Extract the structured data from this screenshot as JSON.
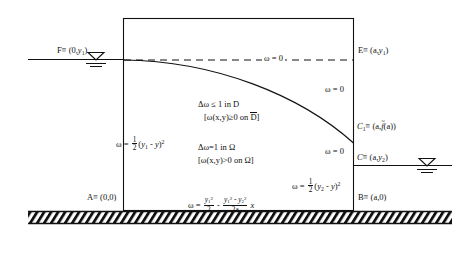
{
  "figure": {
    "type": "free-boundary-seepage-diagram"
  },
  "geometry": {
    "rect": {
      "x": 123,
      "y": 18,
      "w": 231,
      "h": 192
    },
    "water_left_y": 59,
    "water_right_y": 165,
    "ground_y": 211,
    "ground_height": 12,
    "free_surface": {
      "start": [
        123,
        60
      ],
      "end": [
        354,
        143
      ],
      "control1": [
        215,
        61
      ],
      "control2": [
        300,
        95
      ]
    },
    "dashed_y": 60
  },
  "colors": {
    "ink": "#111111",
    "background": "#ffffff",
    "hatch": "#111111"
  },
  "points": {
    "F": {
      "label_name": "F",
      "label_eq": "≡ (0,",
      "sub": "1",
      "close": ")",
      "x": 57,
      "y": 50
    },
    "E": {
      "label_name": "E",
      "label_eq": "≡ (a,",
      "sub": "1",
      "close": ")",
      "x": 358,
      "y": 50
    },
    "C1": {
      "label": "C",
      "sub": "1",
      "eq": "≡ (a,",
      "fn": "f",
      "tilde": "~",
      "arg": "(a))",
      "x": 357,
      "y": 126
    },
    "C": {
      "label": "C",
      "eq": "≡ (a,",
      "sub": "2",
      "close": ")",
      "x": 357,
      "y": 157
    },
    "A": {
      "label": "A",
      "eq": "≡ (0,0)",
      "x": 87,
      "y": 196
    },
    "B": {
      "label": "B",
      "eq": "≡ (a,0)",
      "x": 358,
      "y": 196
    }
  },
  "annotations": {
    "omega_zero_top": {
      "text": "ω = 0",
      "x": 262,
      "y": 56
    },
    "omega_zero_right_upper": {
      "text": "ω = 0",
      "x": 325,
      "y": 88
    },
    "omega_zero_right_lower": {
      "text": "ω = 0",
      "x": 325,
      "y": 150
    },
    "left_wall": {
      "prefix": "ω = ",
      "num": "1",
      "den": "2",
      "body_open": "(",
      "y1": "y",
      "y1sub": "1",
      "minus": " - ",
      "yv": "y",
      "body_close": ")",
      "power": "2",
      "x": 116,
      "y": 140
    },
    "right_wall": {
      "prefix": "ω = ",
      "num": "1",
      "den": "2",
      "body_open": "(",
      "y2": "y",
      "y2sub": "2",
      "minus": " - ",
      "yv": "y",
      "body_close": ")",
      "power": "2",
      "x": 292,
      "y": 182
    },
    "bottom": {
      "prefix": "ω = ",
      "f1num_y": "y",
      "f1num_sub": "1",
      "f1num_sup": "2",
      "f1den": "2",
      "minus": " - ",
      "f2num_y1": "y",
      "f2num_y1sub": "1",
      "f2num_y1sup": "2",
      "f2num_minus": " - ",
      "f2num_y2": "y",
      "f2num_y2sub": "2",
      "f2num_y2sup": "2",
      "f2den": "2a",
      "suffix": " x",
      "x": 188,
      "y": 199
    },
    "domain_D": {
      "line1_a": "Δω ≤ 1  in  D",
      "line2_open": "[ω(x,y)≥0  on  ",
      "line2_sym": "D",
      "line2_close": "]",
      "x": 198,
      "y": 103
    },
    "domain_Omega": {
      "line1": "Δω=1 in Ω",
      "line2": "[ω(x,y)>0 on Ω]",
      "x": 198,
      "y": 146
    }
  },
  "symbols": {
    "water_level_left": {
      "x": 95,
      "y": 59,
      "name": "water-level-symbol"
    },
    "water_level_right": {
      "x": 427,
      "y": 165,
      "name": "water-level-symbol"
    }
  }
}
